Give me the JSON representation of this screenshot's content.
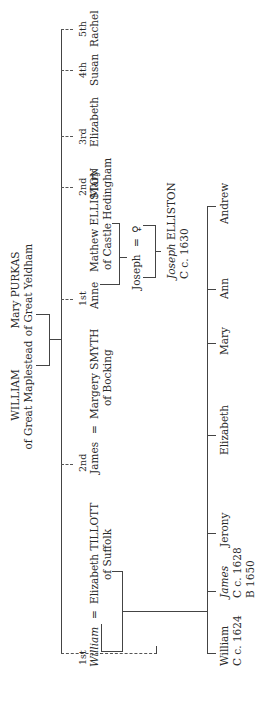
{
  "diagram": {
    "type": "family-tree",
    "orientation": "rotated-90-ccw",
    "generation1": {
      "father": {
        "name": "WILLIAM",
        "place": "of Great Maplestead"
      },
      "mother": {
        "name": "Mary PURKAS",
        "place": "of Great Yeldham"
      }
    },
    "generation2": [
      {
        "order": "1st",
        "name": "William",
        "spouse_sep": "=",
        "spouse": "Elizabeth TILLOTT",
        "spouse_place": "of Suffolk"
      },
      {
        "order": "2nd",
        "name": "James",
        "spouse_sep": "=",
        "spouse": "Margery SMYTH",
        "spouse_place": "of Bocking"
      },
      {
        "order": "1st",
        "name": "Anne",
        "spouse": "Mathew ELLISTON",
        "spouse_place": "of Castle Hedingham"
      },
      {
        "order": "2nd",
        "name": "Mary"
      },
      {
        "order": "3rd",
        "name": "Elizabeth"
      },
      {
        "order": "4th",
        "name": "Susan"
      },
      {
        "order": "5th",
        "name": "Rachel"
      }
    ],
    "elliston_line": {
      "child": {
        "name": "Joseph",
        "sep": "=",
        "spouse": "♀"
      },
      "grandchild": {
        "name": "Joseph",
        "surname": "ELLISTON",
        "note": "C c. 1630"
      }
    },
    "william_children": [
      {
        "name": "William",
        "note1": "C c. 1624"
      },
      {
        "name": "James",
        "note1": "C c. 1628",
        "note2": "B 1650"
      },
      {
        "name": "Jerony"
      },
      {
        "name": "Elizabeth"
      },
      {
        "name": "Mary"
      },
      {
        "name": "Ann"
      },
      {
        "name": "Andrew"
      }
    ]
  }
}
